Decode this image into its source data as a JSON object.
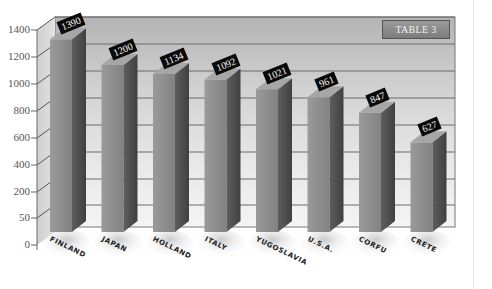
{
  "chart_data": {
    "type": "bar",
    "style": "3d-bar",
    "title": "TABLE 3",
    "categories": [
      "FINLAND",
      "JAPAN",
      "HOLLAND",
      "ITALY",
      "YUGOSLAVIA",
      "U.S.A.",
      "CORFU",
      "CRETE"
    ],
    "values": [
      1390,
      1200,
      1134,
      1092,
      1021,
      961,
      847,
      627
    ],
    "value_labels": [
      "1390",
      "1200",
      "1134",
      "1092",
      "1021",
      "961",
      "847",
      "627"
    ],
    "xlabel": "",
    "ylabel": "",
    "yticks": [
      "0",
      "50",
      "200",
      "400",
      "600",
      "800",
      "1000",
      "1200",
      "1400"
    ],
    "ylim": [
      0,
      1400
    ],
    "grid": true,
    "legend": null
  },
  "colors": {
    "bar_front": "#8c8c8c",
    "bar_side": "#555555",
    "bar_top": "#a8a8a8",
    "wall": "#c8c8c8",
    "gridline": "#6a6a6a",
    "value_label_bg": "#0a0a0a",
    "value_label_text": "#ffffff"
  }
}
